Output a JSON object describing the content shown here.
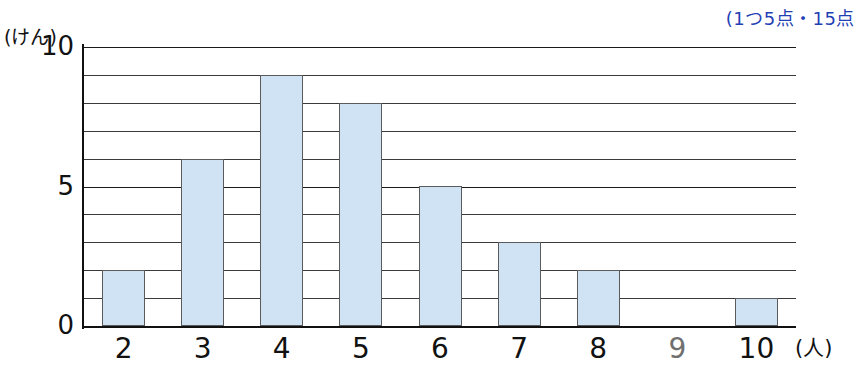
{
  "annotation": {
    "top_right_note": "(1つ5点・15点"
  },
  "axis": {
    "y_unit_label": "(けん)",
    "x_unit_label": "(人)",
    "y_ticks": [
      "0",
      "5",
      "10"
    ],
    "x_ticks": [
      "2",
      "3",
      "4",
      "5",
      "6",
      "7",
      "8",
      "9",
      "10"
    ]
  },
  "colors": {
    "bar_fill": "#cfe3f5",
    "bar_stroke": "#5b5b5b",
    "note_color": "#1f3fb5",
    "axis_color": "#111111"
  },
  "chart_data": {
    "type": "bar",
    "title": "",
    "xlabel": "(人)",
    "ylabel": "(けん)",
    "categories": [
      "2",
      "3",
      "4",
      "5",
      "6",
      "7",
      "8",
      "9",
      "10"
    ],
    "values": [
      2,
      6,
      9,
      8,
      5,
      3,
      2,
      0,
      1
    ],
    "ylim": [
      0,
      10
    ],
    "ytick_labels": [
      "0",
      "5",
      "10"
    ],
    "gridlines": "horizontal, every 1 unit from 0 to 10",
    "legend": "none"
  }
}
